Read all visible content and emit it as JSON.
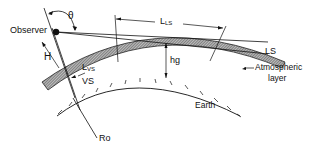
{
  "diagram": {
    "labels": {
      "observer": "Observer",
      "theta": "θ",
      "l_ls_main": "L",
      "l_ls_sub": "LS",
      "ls": "LS",
      "h": "H",
      "l_vs_main": "L",
      "l_vs_sub": "VS",
      "vs": "VS",
      "hg": "hg",
      "atmospheric": "Atmospheric",
      "layer": "layer",
      "earth": "Earth",
      "ro": "Ro"
    },
    "colors": {
      "ink": "#111111",
      "layer_fill": "#8a8a8a",
      "background": "#ffffff"
    }
  }
}
